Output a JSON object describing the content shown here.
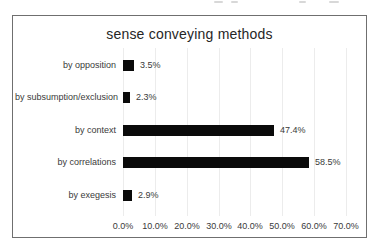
{
  "chart_data": {
    "type": "bar",
    "orientation": "horizontal",
    "title": "sense conveying methods",
    "categories": [
      "by opposition",
      "by subsumption/exclusion",
      "by context",
      "by correlations",
      "by exegesis"
    ],
    "values": [
      3.5,
      2.3,
      47.4,
      58.5,
      2.9
    ],
    "value_labels": [
      "3.5%",
      "2.3%",
      "47.4%",
      "58.5%",
      "2.9%"
    ],
    "x_ticks": [
      "0.0%",
      "10.0%",
      "20.0%",
      "30.0%",
      "40.0%",
      "50.0%",
      "60.0%",
      "70.0%"
    ],
    "x_tick_values": [
      0,
      10,
      20,
      30,
      40,
      50,
      60,
      70
    ],
    "xlim": [
      0,
      70
    ],
    "grid": true,
    "legend": "none",
    "bar_color": "#0a0a0a",
    "gridline_color": "#ececec",
    "text_color": "#3a3a3a",
    "border_color": "#6f6f6f"
  }
}
